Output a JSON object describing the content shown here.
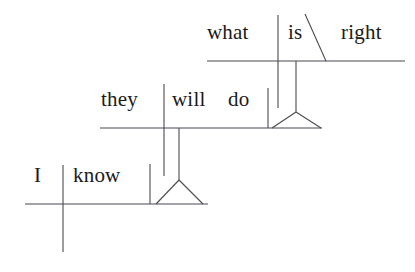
{
  "diagram": {
    "type": "reed-kellogg-sentence-diagram",
    "sentence": "I know they will do what is right",
    "background_color": "#ffffff",
    "line_color": "#4a4a52",
    "text_color": "#1a1a1a",
    "tiers": [
      {
        "id": "tier-top",
        "role": "subordinate-clause-predicate-adjective",
        "words": [
          {
            "id": "w-what",
            "text": "what",
            "role": "subject",
            "x": 207,
            "y": 43
          },
          {
            "id": "w-is",
            "text": "is",
            "role": "linking-verb",
            "x": 288,
            "y": 43
          },
          {
            "id": "w-right",
            "text": "right",
            "role": "predicate-adjective",
            "x": 341,
            "y": 43
          }
        ],
        "baseline": {
          "x1": 207,
          "y1": 61,
          "x2": 405,
          "y2": 61
        },
        "subject_divider": {
          "x": 278,
          "y1": 15,
          "y2": 108
        },
        "slant_line": {
          "x1": 305,
          "y1": 14,
          "x2": 326,
          "y2": 61
        },
        "stem": {
          "x": 296,
          "y1": 61,
          "y2": 112
        },
        "tripod": {
          "apex_x": 296,
          "apex_y": 112,
          "left_x": 272,
          "right_x": 321,
          "base_y": 128
        }
      },
      {
        "id": "tier-middle",
        "role": "noun-clause-as-direct-object",
        "words": [
          {
            "id": "w-they",
            "text": "they",
            "role": "subject",
            "x": 101,
            "y": 110
          },
          {
            "id": "w-will",
            "text": "will",
            "role": "helping-verb",
            "x": 172,
            "y": 110
          },
          {
            "id": "w-do",
            "text": "do",
            "role": "main-verb",
            "x": 228,
            "y": 110
          }
        ],
        "baseline": {
          "x1": 100,
          "y1": 128,
          "x2": 322,
          "y2": 128
        },
        "subject_divider": {
          "x": 164,
          "y1": 84,
          "y2": 176
        },
        "object_bar": {
          "x": 268,
          "y1": 88,
          "y2": 128
        },
        "stem": {
          "x": 179,
          "y1": 128,
          "y2": 180
        },
        "tripod": {
          "apex_x": 179,
          "apex_y": 180,
          "left_x": 156,
          "right_x": 203,
          "base_y": 204
        }
      },
      {
        "id": "tier-bottom",
        "role": "main-clause",
        "words": [
          {
            "id": "w-i",
            "text": "I",
            "role": "subject",
            "x": 34,
            "y": 186
          },
          {
            "id": "w-know",
            "text": "know",
            "role": "transitive-verb",
            "x": 73,
            "y": 186
          }
        ],
        "baseline": {
          "x1": 25,
          "y1": 204,
          "x2": 208,
          "y2": 204
        },
        "subject_divider": {
          "x": 63,
          "y1": 165,
          "y2": 252
        },
        "object_bar": {
          "x": 150,
          "y1": 164,
          "y2": 204
        }
      }
    ]
  }
}
